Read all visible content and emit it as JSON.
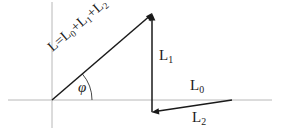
{
  "figure": {
    "background_color": "#ffffff",
    "axis_color": "#b8b8b8",
    "vector_color": "#1a1a1a",
    "label_color": "#1a1a1a"
  },
  "labels": {
    "resultant": "L=L",
    "resultant_sub_0": "0",
    "resultant_plus_1": "+L",
    "resultant_sub_1": "1",
    "resultant_plus_2": "+L",
    "resultant_sub_2": "2",
    "l1_base": "L",
    "l1_sub": "1",
    "l0_base": "L",
    "l0_sub": "0",
    "l2_base": "L",
    "l2_sub": "2",
    "angle": "φ"
  },
  "geometry": {
    "origin": {
      "x": 52,
      "y": 100
    },
    "apex": {
      "x": 152,
      "y": 14
    },
    "l2_right_end": {
      "x": 232,
      "y": 100
    },
    "l2_left_end": {
      "x": 152,
      "y": 112
    },
    "horizontal_axis": {
      "x1": 8,
      "y1": 100,
      "x2": 272,
      "y2": 100
    },
    "vertical_axis": {
      "x1": 52,
      "y1": 2,
      "x2": 52,
      "y2": 128
    },
    "angle_arc_radius": 40,
    "angle_degrees": 40.7
  }
}
